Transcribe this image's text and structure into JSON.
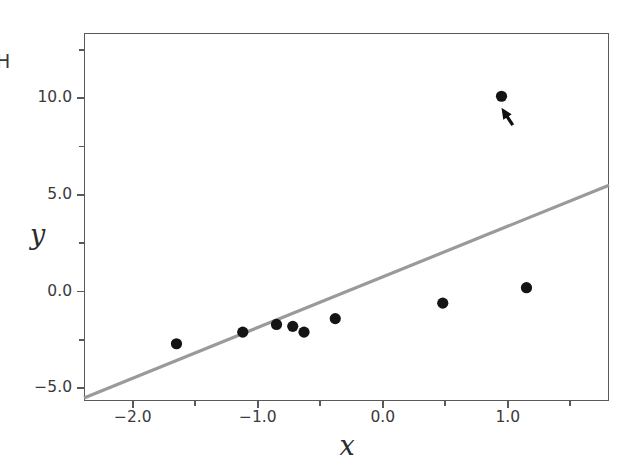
{
  "chart_data": {
    "type": "scatter",
    "title": "",
    "xlabel": "x",
    "ylabel": "y",
    "xlim": [
      -2.39,
      1.81
    ],
    "ylim": [
      -5.66,
      13.37
    ],
    "grid": false,
    "legend": null,
    "x_ticks": [
      {
        "value": -2.0,
        "label": "-2.0",
        "major": true
      },
      {
        "value": -1.5,
        "label": "",
        "major": false
      },
      {
        "value": -1.0,
        "label": "-1.0",
        "major": true
      },
      {
        "value": -0.5,
        "label": "",
        "major": false
      },
      {
        "value": 0.0,
        "label": "0.0",
        "major": true
      },
      {
        "value": 0.5,
        "label": "",
        "major": false
      },
      {
        "value": 1.0,
        "label": "1.0",
        "major": true
      },
      {
        "value": 1.5,
        "label": "",
        "major": false
      }
    ],
    "y_ticks": [
      {
        "value": 12.5,
        "label": "",
        "major": false
      },
      {
        "value": 10.0,
        "label": "10.0",
        "major": true
      },
      {
        "value": 7.5,
        "label": "",
        "major": false
      },
      {
        "value": 5.0,
        "label": "5.0",
        "major": true
      },
      {
        "value": 2.5,
        "label": "",
        "major": false
      },
      {
        "value": 0.0,
        "label": "0.0",
        "major": true
      },
      {
        "value": -2.5,
        "label": "",
        "major": false
      },
      {
        "value": -5.0,
        "label": "-5.0",
        "major": true
      }
    ],
    "series": [
      {
        "name": "observations",
        "type": "scatter",
        "marker": "circle",
        "color": "#141414",
        "points": [
          {
            "x": -1.65,
            "y": -2.7
          },
          {
            "x": -1.12,
            "y": -2.1
          },
          {
            "x": -0.85,
            "y": -1.7
          },
          {
            "x": -0.72,
            "y": -1.8
          },
          {
            "x": -0.63,
            "y": -2.1
          },
          {
            "x": -0.38,
            "y": -1.4
          },
          {
            "x": 0.48,
            "y": -0.6
          },
          {
            "x": 0.95,
            "y": 10.1
          },
          {
            "x": 1.15,
            "y": 0.2
          }
        ]
      },
      {
        "name": "fit-line",
        "type": "line",
        "color": "#9a9a9a",
        "endpoints": [
          {
            "x": -2.39,
            "y": -5.5
          },
          {
            "x": 1.81,
            "y": 5.5
          }
        ]
      }
    ],
    "annotations": [
      {
        "name": "outlier-arrow",
        "type": "arrow",
        "tail": {
          "x": 1.04,
          "y": 8.6
        },
        "head": {
          "x": 0.95,
          "y": 9.5
        },
        "color": "#101010",
        "text": ""
      }
    ],
    "corner_text": "H"
  }
}
